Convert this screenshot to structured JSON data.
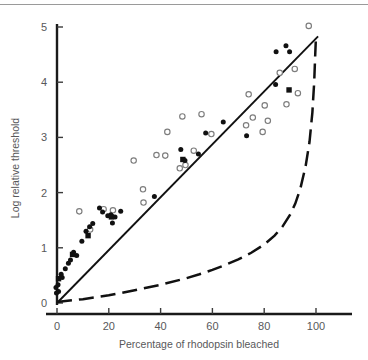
{
  "chart_data": {
    "type": "scatter",
    "title": "",
    "xlabel": "Percentage of rhodopsin bleached",
    "ylabel": "Log relative threshold",
    "xlim": [
      -4,
      108
    ],
    "ylim": [
      -0.18,
      5.25
    ],
    "xticks": [
      0,
      20,
      40,
      60,
      80,
      100
    ],
    "yticks": [
      0,
      1,
      2,
      3,
      4,
      5
    ],
    "xtick_labels": [
      "0",
      "20",
      "40",
      "60",
      "80",
      "100"
    ],
    "ytick_labels": [
      "0",
      "1",
      "2",
      "3",
      "4",
      "5"
    ],
    "grid": false,
    "legend": null,
    "series": [
      {
        "name": "filled-circles",
        "marker": "filled-circle",
        "color": "#111111",
        "points": [
          [
            -0.4,
            0.28
          ],
          [
            -0.2,
            0.18
          ],
          [
            0.4,
            0.33
          ],
          [
            0.6,
            0.21
          ],
          [
            1.6,
            0.52
          ],
          [
            2.0,
            0.46
          ],
          [
            3.2,
            0.62
          ],
          [
            4.4,
            0.72
          ],
          [
            5.2,
            0.78
          ],
          [
            6.4,
            0.92
          ],
          [
            7.6,
            0.86
          ],
          [
            9.6,
            1.12
          ],
          [
            11.2,
            1.3
          ],
          [
            12.6,
            1.38
          ],
          [
            13.8,
            1.44
          ],
          [
            16.4,
            1.72
          ],
          [
            17.6,
            1.65
          ],
          [
            19.6,
            1.58
          ],
          [
            20.8,
            1.6
          ],
          [
            21.4,
            1.45
          ],
          [
            22.4,
            1.56
          ],
          [
            24.6,
            1.66
          ],
          [
            37.6,
            1.93
          ],
          [
            47.8,
            2.78
          ],
          [
            49.4,
            2.58
          ],
          [
            54.6,
            2.7
          ],
          [
            57.4,
            3.08
          ],
          [
            64.2,
            3.28
          ],
          [
            73.2,
            3.03
          ],
          [
            84.4,
            3.96
          ],
          [
            84.6,
            4.55
          ],
          [
            88.4,
            4.66
          ],
          [
            89.8,
            4.55
          ]
        ]
      },
      {
        "name": "open-circles",
        "marker": "open-circle",
        "color": "#7d7d7d",
        "points": [
          [
            8.6,
            1.66
          ],
          [
            12.8,
            1.33
          ],
          [
            18.0,
            1.7
          ],
          [
            21.6,
            1.68
          ],
          [
            29.6,
            2.58
          ],
          [
            33.2,
            2.06
          ],
          [
            33.4,
            1.82
          ],
          [
            38.4,
            2.68
          ],
          [
            41.8,
            2.67
          ],
          [
            42.6,
            3.1
          ],
          [
            47.4,
            2.44
          ],
          [
            48.4,
            3.38
          ],
          [
            49.6,
            2.5
          ],
          [
            52.8,
            2.76
          ],
          [
            55.8,
            3.42
          ],
          [
            59.6,
            3.06
          ],
          [
            73.0,
            3.22
          ],
          [
            74.0,
            3.78
          ],
          [
            75.6,
            3.36
          ],
          [
            79.4,
            3.1
          ],
          [
            80.2,
            3.58
          ],
          [
            81.4,
            3.3
          ],
          [
            86.0,
            4.17
          ],
          [
            88.6,
            3.6
          ],
          [
            91.8,
            4.24
          ],
          [
            93.0,
            3.8
          ],
          [
            97.2,
            5.02
          ]
        ]
      },
      {
        "name": "filled-squares",
        "marker": "filled-square",
        "color": "#111111",
        "points": [
          [
            0.6,
            0.44
          ],
          [
            6.0,
            0.88
          ],
          [
            12.0,
            1.22
          ],
          [
            21.0,
            1.56
          ],
          [
            48.6,
            2.6
          ],
          [
            89.6,
            3.86
          ]
        ]
      }
    ],
    "lines": [
      {
        "name": "proportionality-line",
        "style": "solid",
        "color": "#111111",
        "points": [
          [
            0,
            0
          ],
          [
            100.8,
            4.83
          ]
        ]
      },
      {
        "name": "rhodopsin-density-curve",
        "style": "dashed",
        "color": "#111111",
        "points": [
          [
            0,
            0.02
          ],
          [
            10,
            0.07
          ],
          [
            20,
            0.14
          ],
          [
            30,
            0.23
          ],
          [
            40,
            0.33
          ],
          [
            50,
            0.45
          ],
          [
            55,
            0.52
          ],
          [
            60,
            0.6
          ],
          [
            65,
            0.69
          ],
          [
            70,
            0.79
          ],
          [
            75,
            0.91
          ],
          [
            80,
            1.06
          ],
          [
            84,
            1.22
          ],
          [
            87,
            1.38
          ],
          [
            90,
            1.6
          ],
          [
            92,
            1.8
          ],
          [
            94,
            2.08
          ],
          [
            96,
            2.48
          ],
          [
            97.5,
            2.92
          ],
          [
            98.6,
            3.45
          ],
          [
            99.3,
            4.0
          ],
          [
            99.7,
            4.5
          ],
          [
            100.0,
            4.84
          ]
        ]
      }
    ]
  },
  "axes": {
    "xlabel": "Percentage of rhodopsin bleached",
    "ylabel": "Log relative threshold"
  }
}
